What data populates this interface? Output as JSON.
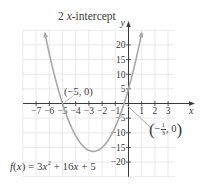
{
  "chart_data": {
    "type": "line",
    "title": "2 x-intercept",
    "title_parts": {
      "count": "2",
      "var": "x",
      "rest": "-intercept"
    },
    "function_label": "f(x) = 3x² + 16x + 5",
    "function": {
      "a": 3,
      "b": 16,
      "c": 5
    },
    "xlabel": "x",
    "ylabel": "y",
    "xlim": [
      -8,
      4
    ],
    "ylim": [
      -25,
      25
    ],
    "grid": true,
    "x_grid_step": 1,
    "y_grid_step": 5,
    "x_ticks": [
      -7,
      -6,
      -5,
      -4,
      -3,
      -2,
      -1,
      1,
      2,
      3
    ],
    "x_tick_labels": [
      "−7",
      "−6",
      "−5",
      "−4",
      "−3",
      "−2",
      "−1",
      "1",
      "2",
      "3"
    ],
    "y_ticks": [
      20,
      15,
      10,
      5,
      -5,
      -10,
      -15,
      -20
    ],
    "y_tick_labels": [
      "20",
      "15",
      "10",
      "5",
      "−5",
      "−10",
      "−15",
      "−20"
    ],
    "curve_x_range": [
      -6.33,
      1.0
    ],
    "vertex": {
      "x": -2.667,
      "y": -16.33
    },
    "annotations": [
      {
        "label": "(−5, 0)",
        "x": -5,
        "y": 0
      },
      {
        "label": "(−1/3, 0)",
        "x": -0.333,
        "y": 0
      }
    ],
    "colors": {
      "curve": "#a8a8a8",
      "axis": "#3a3a3a",
      "grid": "#e4e4e4",
      "text": "#3a3a3a"
    }
  },
  "labels": {
    "title_count": "2",
    "title_var": "x",
    "title_rest": "-intercept",
    "point_left": "(−5, 0)",
    "point_right_open": "(",
    "point_right_sign": "−",
    "point_right_num": "1",
    "point_right_den": "3",
    "point_right_rest": ", 0",
    "point_right_close": ")",
    "func_f": "f",
    "func_open": "(",
    "func_x": "x",
    "func_close": ") = 3",
    "func_x2": "x",
    "func_sup": "2",
    "func_mid": " + 16",
    "func_x3": "x",
    "func_end": " + 5"
  }
}
